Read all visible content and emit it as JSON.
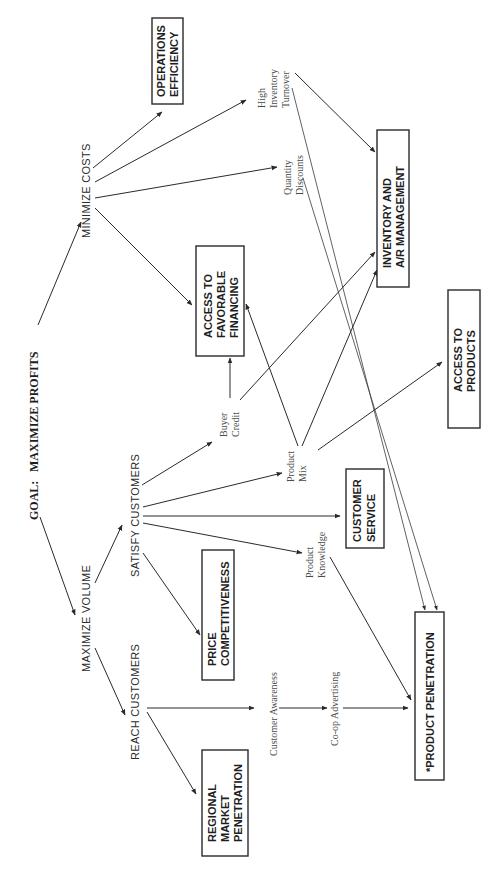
{
  "diagram": {
    "orientation": "rotated-90-ccw",
    "goal": {
      "prefix": "GOAL:",
      "label": "MAXIMIZE PROFITS"
    },
    "objectives": [
      {
        "id": "minimize-costs",
        "label": "MINIMIZE COSTS"
      },
      {
        "id": "maximize-volume",
        "label": "MAXIMIZE VOLUME"
      },
      {
        "id": "satisfy-customers",
        "label": "SATISFY CUSTOMERS"
      },
      {
        "id": "reach-customers",
        "label": "REACH CUSTOMERS"
      }
    ],
    "factors": [
      {
        "id": "high-inventory-turnover",
        "lines": [
          "High",
          "Inventory",
          "Turnover"
        ]
      },
      {
        "id": "quantity-discounts",
        "lines": [
          "Quantity",
          "Discounts"
        ]
      },
      {
        "id": "buyer-credit",
        "lines": [
          "Buyer",
          "Credit"
        ]
      },
      {
        "id": "product-mix",
        "lines": [
          "Product",
          "Mix"
        ]
      },
      {
        "id": "product-knowledge",
        "lines": [
          "Product",
          "Knowledge"
        ]
      },
      {
        "id": "customer-awareness",
        "lines": [
          "Customer  Awareness"
        ]
      },
      {
        "id": "co-op-advertising",
        "lines": [
          "Co-op  Advertising"
        ]
      }
    ],
    "outcome_boxes": [
      {
        "id": "operations-efficiency",
        "lines": [
          "OPERATIONS",
          "EFFICIENCY"
        ]
      },
      {
        "id": "inventory-ar-management",
        "lines": [
          "INVENTORY AND",
          "A/R MANAGEMENT"
        ]
      },
      {
        "id": "access-to-favorable-financing",
        "lines": [
          "ACCESS TO",
          "FAVORABLE",
          "FINANCING"
        ]
      },
      {
        "id": "access-to-products",
        "lines": [
          "ACCESS TO",
          "PRODUCTS"
        ]
      },
      {
        "id": "customer-service",
        "lines": [
          "CUSTOMER",
          "SERVICE"
        ]
      },
      {
        "id": "price-competitiveness",
        "lines": [
          "PRICE",
          "COMPETITIVENESS"
        ]
      },
      {
        "id": "product-penetration",
        "lines": [
          "*PRODUCT PENETRATION"
        ]
      },
      {
        "id": "regional-market-penetration",
        "lines": [
          "REGIONAL",
          "MARKET",
          "PENETRATION"
        ]
      }
    ],
    "edges": [
      [
        "maximize-profits",
        "minimize-costs"
      ],
      [
        "maximize-profits",
        "maximize-volume"
      ],
      [
        "minimize-costs",
        "operations-efficiency"
      ],
      [
        "minimize-costs",
        "high-inventory-turnover"
      ],
      [
        "minimize-costs",
        "quantity-discounts"
      ],
      [
        "minimize-costs",
        "access-to-favorable-financing"
      ],
      [
        "high-inventory-turnover",
        "inventory-ar-management"
      ],
      [
        "high-inventory-turnover",
        "product-penetration"
      ],
      [
        "quantity-discounts",
        "product-penetration"
      ],
      [
        "maximize-volume",
        "satisfy-customers"
      ],
      [
        "maximize-volume",
        "reach-customers"
      ],
      [
        "satisfy-customers",
        "buyer-credit"
      ],
      [
        "satisfy-customers",
        "product-mix"
      ],
      [
        "satisfy-customers",
        "customer-service"
      ],
      [
        "satisfy-customers",
        "product-knowledge"
      ],
      [
        "satisfy-customers",
        "price-competitiveness"
      ],
      [
        "buyer-credit",
        "access-to-favorable-financing"
      ],
      [
        "buyer-credit",
        "inventory-ar-management"
      ],
      [
        "product-mix",
        "access-to-favorable-financing"
      ],
      [
        "product-mix",
        "inventory-ar-management"
      ],
      [
        "product-mix",
        "access-to-products"
      ],
      [
        "product-knowledge",
        "product-penetration"
      ],
      [
        "reach-customers",
        "customer-awareness"
      ],
      [
        "reach-customers",
        "regional-market-penetration"
      ],
      [
        "customer-awareness",
        "co-op-advertising"
      ],
      [
        "co-op-advertising",
        "product-penetration"
      ]
    ]
  }
}
